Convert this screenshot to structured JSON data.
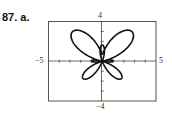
{
  "problem": {
    "label": "87.  a."
  },
  "chart_data": {
    "type": "line",
    "subtype": "polar",
    "title": "",
    "equation": "r = e^(sin θ) − 2cos(4θ)",
    "theta_range": [
      0,
      6.2832
    ],
    "xlim": [
      -5,
      5
    ],
    "ylim": [
      -4,
      4
    ],
    "xlabel": "",
    "ylabel": "",
    "grid": false,
    "tick_labels": {
      "xmin": "−5",
      "xmax": "5",
      "ymin": "−4",
      "ymax": "4"
    },
    "x_ticks": [
      -4,
      -3,
      -2,
      -1,
      1,
      2,
      3,
      4
    ],
    "y_ticks": [
      -3,
      -2,
      -1,
      1,
      2,
      3
    ],
    "sample_points": [
      {
        "theta_deg": 0,
        "r": -1.0
      },
      {
        "theta_deg": 45,
        "r": 4.03
      },
      {
        "theta_deg": 90,
        "r": 0.72
      },
      {
        "theta_deg": 135,
        "r": 4.03
      },
      {
        "theta_deg": 180,
        "r": -1.0
      },
      {
        "theta_deg": 225,
        "r": 2.49
      },
      {
        "theta_deg": 270,
        "r": -1.63
      },
      {
        "theta_deg": 315,
        "r": 2.49
      }
    ],
    "line_color": "#111111",
    "frame_color": "#555555"
  }
}
